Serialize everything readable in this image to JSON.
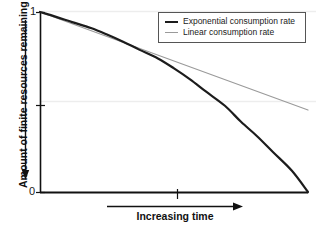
{
  "chart_data": {
    "type": "line",
    "title": "",
    "xlabel": "Increasing time",
    "ylabel": "Amount of finite resources remaining",
    "xlim": [
      0,
      1
    ],
    "ylim": [
      0,
      1
    ],
    "grid": true,
    "grid_lines_y": [
      0.5,
      1.0
    ],
    "legend_position": "top-right",
    "y_tick_labels": [
      "1",
      "0"
    ],
    "y_ticks": [
      1,
      0.5,
      0
    ],
    "x_ticks": [
      0.51
    ],
    "x_tick_labels": [
      ""
    ],
    "annotations": [
      {
        "name": "y-axis-direction-arrow",
        "text": "",
        "direction": "down"
      },
      {
        "name": "x-axis-direction-arrow",
        "text": "",
        "direction": "right"
      }
    ],
    "series": [
      {
        "name": "Exponential consumption rate",
        "color": "#1c1c1c",
        "width": 2.2,
        "x": [
          0.0,
          0.06,
          0.12,
          0.19,
          0.25,
          0.31,
          0.37,
          0.44,
          0.5,
          0.56,
          0.62,
          0.69,
          0.75,
          0.81,
          0.87,
          0.94,
          1.0
        ],
        "y": [
          1.0,
          0.973,
          0.944,
          0.911,
          0.875,
          0.835,
          0.791,
          0.742,
          0.687,
          0.626,
          0.557,
          0.479,
          0.39,
          0.31,
          0.221,
          0.118,
          0.0
        ]
      },
      {
        "name": "Linear consumption rate",
        "color": "#9a9a9a",
        "width": 1.1,
        "x": [
          0.0,
          1.0
        ],
        "y": [
          1.0,
          0.455
        ]
      }
    ]
  },
  "legend": {
    "entries": [
      {
        "label": "Exponential consumption rate",
        "swatch": "exp"
      },
      {
        "label": "Linear consumption rate",
        "swatch": "lin"
      }
    ]
  },
  "axes": {
    "y_top_label": "1",
    "y_bottom_label": "0",
    "y_title": "Amount of finite resources remaining",
    "x_title": "Increasing time"
  },
  "colors": {
    "exponential": "#1c1c1c",
    "linear": "#9a9a9a",
    "axis": "#111111",
    "gridline": "#ededed",
    "background": "#ffffff"
  }
}
